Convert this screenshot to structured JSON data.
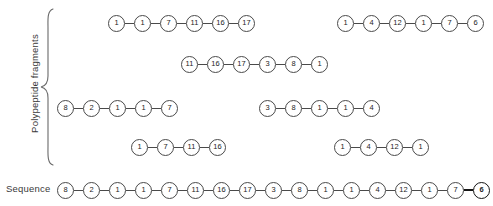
{
  "labels": {
    "group": "Polypeptide fragments",
    "sequence": "Sequence"
  },
  "colors": {
    "node_stroke": "#4a4a4a",
    "node_fill": "#ffffff",
    "text": "#1d1d1d",
    "background": "#ffffff",
    "emphasis": "#151515"
  },
  "fragments": [
    {
      "id": "fragment-row1-left",
      "row": 1,
      "left": 108,
      "top": 14,
      "values": [
        1,
        1,
        7,
        11,
        16,
        17
      ]
    },
    {
      "id": "fragment-row1-right",
      "row": 1,
      "left": 337,
      "top": 14,
      "values": [
        1,
        4,
        12,
        1,
        7,
        6
      ]
    },
    {
      "id": "fragment-row2",
      "row": 2,
      "left": 181,
      "top": 55,
      "values": [
        11,
        16,
        17,
        3,
        8,
        1
      ]
    },
    {
      "id": "fragment-row3-left",
      "row": 3,
      "left": 57,
      "top": 99,
      "values": [
        8,
        2,
        1,
        1,
        7
      ]
    },
    {
      "id": "fragment-row3-right",
      "row": 3,
      "left": 259,
      "top": 99,
      "values": [
        3,
        8,
        1,
        1,
        4
      ]
    },
    {
      "id": "fragment-row4-left",
      "row": 4,
      "left": 131,
      "top": 138,
      "values": [
        1,
        7,
        11,
        16
      ]
    },
    {
      "id": "fragment-row4-right",
      "row": 4,
      "left": 334,
      "top": 138,
      "values": [
        1,
        4,
        12,
        1
      ]
    }
  ],
  "sequence": {
    "id": "sequence-chain",
    "left": 57,
    "top": 181,
    "values": [
      8,
      2,
      1,
      1,
      7,
      11,
      16,
      17,
      3,
      8,
      1,
      1,
      4,
      12,
      1,
      7,
      6
    ],
    "emphasized_index": 16
  },
  "chart_data": {
    "type": "diagram",
    "fragment_sets": [
      [
        1,
        1,
        7,
        11,
        16,
        17
      ],
      [
        1,
        4,
        12,
        1,
        7,
        6
      ],
      [
        11,
        16,
        17,
        3,
        8,
        1
      ],
      [
        8,
        2,
        1,
        1,
        7
      ],
      [
        3,
        8,
        1,
        1,
        4
      ],
      [
        1,
        7,
        11,
        16
      ],
      [
        1,
        4,
        12,
        1
      ]
    ],
    "full_sequence": [
      8,
      2,
      1,
      1,
      7,
      11,
      16,
      17,
      3,
      8,
      1,
      1,
      4,
      12,
      1,
      7,
      6
    ]
  }
}
